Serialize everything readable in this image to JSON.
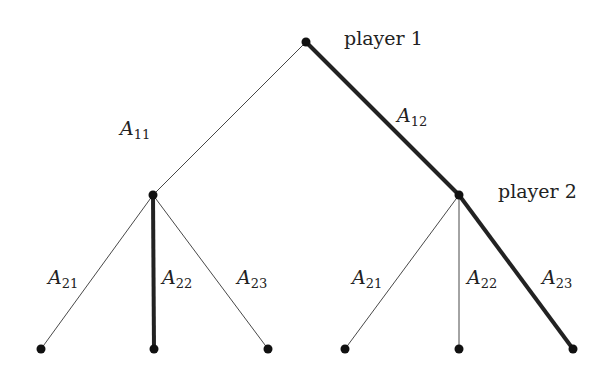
{
  "diagram": {
    "type": "game-tree",
    "players": [
      {
        "id": "p1",
        "label": "player 1"
      },
      {
        "id": "p2",
        "label": "player 2"
      }
    ],
    "nodes": [
      {
        "id": "root",
        "x": 306,
        "y": 42,
        "player": "p1"
      },
      {
        "id": "n_left",
        "x": 153,
        "y": 195
      },
      {
        "id": "n_right",
        "x": 459,
        "y": 195,
        "player": "p2"
      },
      {
        "id": "leaf1",
        "x": 41,
        "y": 349
      },
      {
        "id": "leaf2",
        "x": 154,
        "y": 349
      },
      {
        "id": "leaf3",
        "x": 268,
        "y": 349
      },
      {
        "id": "leaf4",
        "x": 345,
        "y": 349
      },
      {
        "id": "leaf5",
        "x": 459,
        "y": 349
      },
      {
        "id": "leaf6",
        "x": 573,
        "y": 349
      }
    ],
    "edges": [
      {
        "from": "root",
        "to": "n_left",
        "label": {
          "base": "A",
          "sub": "11"
        },
        "bold": false
      },
      {
        "from": "root",
        "to": "n_right",
        "label": {
          "base": "A",
          "sub": "12"
        },
        "bold": true
      },
      {
        "from": "n_left",
        "to": "leaf1",
        "label": {
          "base": "A",
          "sub": "21"
        },
        "bold": false
      },
      {
        "from": "n_left",
        "to": "leaf2",
        "label": {
          "base": "A",
          "sub": "22"
        },
        "bold": true
      },
      {
        "from": "n_left",
        "to": "leaf3",
        "label": {
          "base": "A",
          "sub": "23"
        },
        "bold": false
      },
      {
        "from": "n_right",
        "to": "leaf4",
        "label": {
          "base": "A",
          "sub": "21"
        },
        "bold": false
      },
      {
        "from": "n_right",
        "to": "leaf5",
        "label": {
          "base": "A",
          "sub": "22"
        },
        "bold": false
      },
      {
        "from": "n_right",
        "to": "leaf6",
        "label": {
          "base": "A",
          "sub": "23"
        },
        "bold": true
      }
    ]
  }
}
